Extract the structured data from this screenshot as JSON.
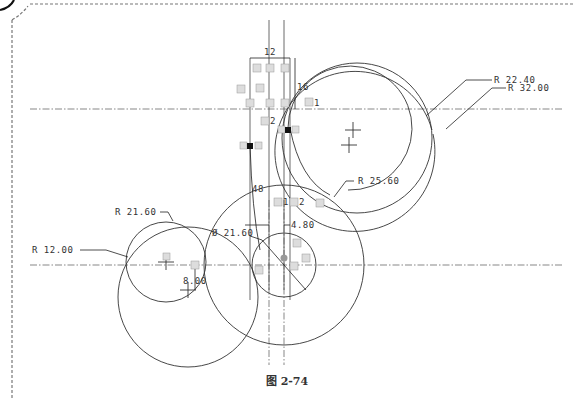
{
  "figure": {
    "caption": "图 2-74"
  },
  "dimensions": {
    "r_22_40": "R 22.40",
    "r_32_00": "R 32.00",
    "r_25_60": "R 25.60",
    "r_21_60": "R 21.60",
    "r_12_00": "R 12.00",
    "dia_21_60": "Ø 21.60",
    "d_4_80": "4.80",
    "d_8_00": "8.00",
    "d_12": "12",
    "d_16": "16",
    "d_48": "48"
  },
  "constraints": {
    "perp1": "1",
    "perp2": "2",
    "perp1b": "1",
    "perp2b": "2"
  },
  "colors": {
    "line": "#333333",
    "frame": "#777777"
  }
}
